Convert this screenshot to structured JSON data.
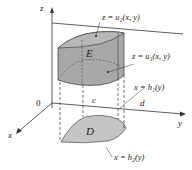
{
  "diagram": {
    "axes": {
      "z_label": "z",
      "x_label": "x",
      "y_label": "y",
      "origin_label": "0"
    },
    "region_labels": {
      "solid": "E",
      "base": "D"
    },
    "y_ticks": {
      "c": "c",
      "d": "d"
    },
    "annotations": {
      "upper_surface": "z = u₂(x, y)",
      "lower_surface": "z = u₁(x, y)",
      "back_boundary": "x = h₁(y)",
      "front_boundary": "x = h₂(y)"
    },
    "colors": {
      "solid_fill": "#a8a8a8",
      "solid_top": "#b8b8b8",
      "base_fill": "#c4c4c4",
      "stroke": "#333333"
    }
  }
}
